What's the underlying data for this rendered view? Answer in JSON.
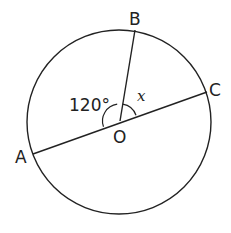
{
  "diagram": {
    "type": "circle-geometry",
    "center": {
      "label": "O",
      "x": 120,
      "y": 121
    },
    "radius": 92,
    "points": [
      {
        "label": "A",
        "x": 33,
        "y": 154
      },
      {
        "label": "B",
        "x": 135,
        "y": 30
      },
      {
        "label": "C",
        "x": 207,
        "y": 92
      }
    ],
    "segments": [
      "AC (diameter through O)",
      "OB (radius)"
    ],
    "angles": [
      {
        "label": "120°",
        "between": "AOB"
      },
      {
        "label": "x",
        "between": "BOC"
      }
    ],
    "colors": {
      "stroke": "#222222",
      "background": "#ffffff"
    }
  },
  "labels": {
    "A": "A",
    "B": "B",
    "C": "C",
    "O": "O",
    "angle_aob": "120°",
    "angle_boc": "x"
  }
}
